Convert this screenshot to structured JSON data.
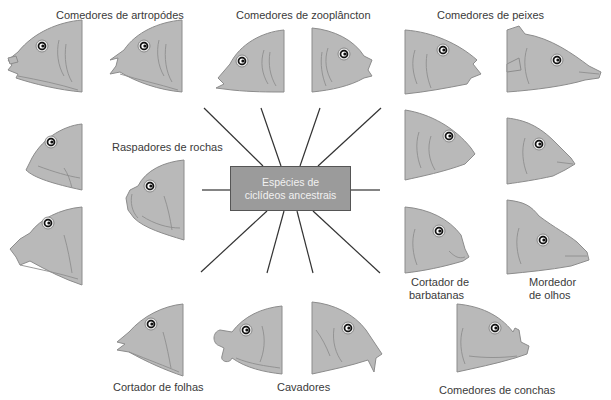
{
  "diagram": {
    "center": {
      "line1": "Espécies de",
      "line2": "ciclídeos ancestrais"
    },
    "groups": [
      {
        "id": "arthropods",
        "label": "Comedores de artropódes"
      },
      {
        "id": "zooplankton",
        "label": "Comedores de zooplâncton"
      },
      {
        "id": "fish",
        "label": "Comedores de peixes"
      },
      {
        "id": "rock",
        "label": "Raspadores de rochas"
      },
      {
        "id": "fin",
        "label_line1": "Cortador de",
        "label_line2": "barbatanas"
      },
      {
        "id": "eye",
        "label_line1": "Mordedor",
        "label_line2": "de olhos"
      },
      {
        "id": "leaf",
        "label": "Cortador de folhas"
      },
      {
        "id": "dig",
        "label": "Cavadores"
      },
      {
        "id": "shell",
        "label": "Comedores de conchas"
      }
    ],
    "colors": {
      "fish_fill": "#b9b9b9",
      "fish_outline": "#8c8c8c",
      "box_fill": "#9b9b9b",
      "box_text": "#f1f1f1",
      "spoke": "#333333",
      "label_text": "#3a3a3a"
    }
  }
}
